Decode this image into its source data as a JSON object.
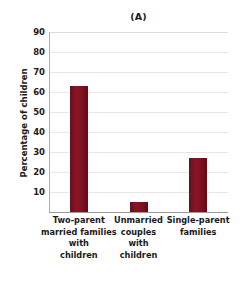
{
  "chart_data": {
    "type": "bar",
    "title": "(A)",
    "xlabel": "",
    "ylabel": "Percentage of children",
    "ylim": [
      0,
      90
    ],
    "ytick_step": 10,
    "yticks": [
      90,
      80,
      70,
      60,
      50,
      40,
      30,
      20,
      10
    ],
    "grid": true,
    "legend": null,
    "bar_color": "#7b1020",
    "gridline_color": "#e8e8e8",
    "axis_color": "#9a9a9a",
    "categories": [
      "Two-parent married families with children",
      "Unmarried couples with children",
      "Single-parent families"
    ],
    "category_lines": [
      [
        "Two-parent",
        "married families",
        "with",
        "children"
      ],
      [
        "Unmarried",
        "couples",
        "with",
        "children"
      ],
      [
        "Single-parent",
        "families"
      ]
    ],
    "values": [
      63,
      5,
      27
    ]
  }
}
